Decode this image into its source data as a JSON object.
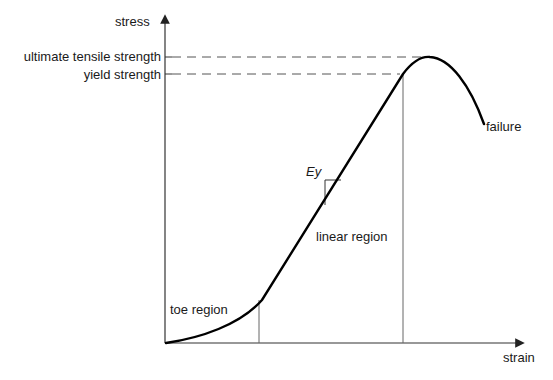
{
  "diagram": {
    "type": "stress-strain curve",
    "axes": {
      "y_label": "stress",
      "x_label": "strain"
    },
    "y_levels": {
      "ultimate": "ultimate tensile strength",
      "yield": "yield strength"
    },
    "regions": {
      "toe": "toe region",
      "linear": "linear region"
    },
    "slope_label": "Ey",
    "end_label": "failure",
    "colors": {
      "curve": "#000000",
      "axis": "#333333",
      "guide": "#555555",
      "text": "#1a1a1a"
    }
  }
}
